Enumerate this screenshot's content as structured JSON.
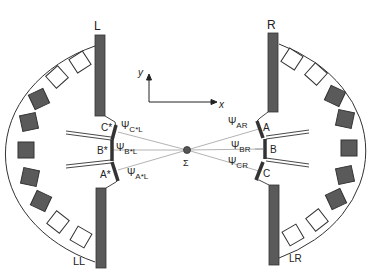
{
  "diagram": {
    "type": "spectrometer-geometry",
    "colors": {
      "block_fill": "#5a5a5a",
      "block_open": "#ffffff",
      "stroke": "#333333",
      "beam": "#9a9a9a"
    },
    "labels": {
      "L": "L",
      "R": "R",
      "LL": "LL",
      "LR": "LR",
      "y_axis": "y",
      "x_axis": "x",
      "center": "Σ"
    },
    "left_crystals": [
      {
        "name": "C*",
        "label": "C*",
        "psi": "Ψ",
        "psi_sub": "C*L"
      },
      {
        "name": "B*",
        "label": "B*",
        "psi": "Ψ",
        "psi_sub": "B*L"
      },
      {
        "name": "A*",
        "label": "A*",
        "psi": "Ψ",
        "psi_sub": "A*L"
      }
    ],
    "right_crystals": [
      {
        "name": "A",
        "label": "A",
        "psi": "Ψ",
        "psi_sub": "AR"
      },
      {
        "name": "B",
        "label": "B",
        "psi": "Ψ",
        "psi_sub": "BR"
      },
      {
        "name": "C",
        "label": "C",
        "psi": "Ψ",
        "psi_sub": "CR"
      }
    ],
    "detector_blocks": {
      "per_side": 9,
      "pattern": [
        "open",
        "open",
        "filled",
        "filled",
        "filled",
        "filled",
        "filled",
        "open",
        "open"
      ]
    }
  }
}
